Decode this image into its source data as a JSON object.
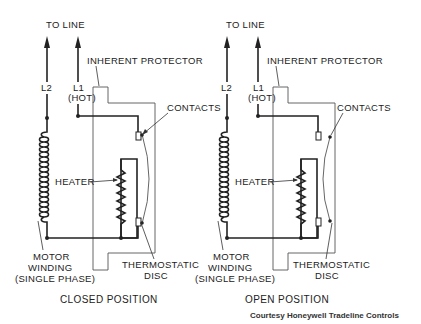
{
  "diagrams": [
    {
      "id": "closed",
      "to_line": "TO LINE",
      "l2": "L2",
      "l1": "L1",
      "l1_sub": "(HOT)",
      "protector": "INHERENT PROTECTOR",
      "contacts": "CONTACTS",
      "heater": "HEATER",
      "motor_1": "MOTOR",
      "motor_2": "WINDING",
      "motor_3": "(SINGLE PHASE)",
      "disc_1": "THERMOSTATIC",
      "disc_2": "DISC",
      "caption": "CLOSED POSITION",
      "state": "closed"
    },
    {
      "id": "open",
      "to_line": "TO LINE",
      "l2": "L2",
      "l1": "L1",
      "l1_sub": "(HOT)",
      "protector": "INHERENT PROTECTOR",
      "contacts": "CONTACTS",
      "heater": "HEATER",
      "motor_1": "MOTOR",
      "motor_2": "WINDING",
      "motor_3": "(SINGLE PHASE)",
      "disc_1": "THERMOSTATIC",
      "disc_2": "DISC",
      "caption": "OPEN POSITION",
      "state": "open"
    }
  ],
  "credit": "Courtesy Honeywell Tradeline Controls"
}
